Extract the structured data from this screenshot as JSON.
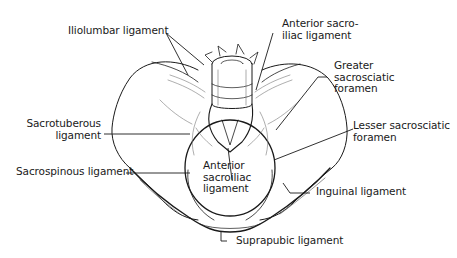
{
  "diagram": {
    "labels": [
      {
        "id": "iliolumbar",
        "text": "Iliolumbar ligament"
      },
      {
        "id": "anterior_sacroiliac_top",
        "text": "Anterior sacro-\niliac ligament"
      },
      {
        "id": "greater_sacrosciatic",
        "text": "Greater\nsacrosciatic\nforamen"
      },
      {
        "id": "sacrotuberous",
        "text": "Sacrotuberous\nligament"
      },
      {
        "id": "lesser_sacrosciatic",
        "text": "Lesser sacrosciatic\nforamen"
      },
      {
        "id": "anterior_sacroiliac_center",
        "text": "Anterior\nsacroiliac\nligament"
      },
      {
        "id": "sacrospinous",
        "text": "Sacrospinous ligament"
      },
      {
        "id": "inguinal",
        "text": "Inguinal ligament"
      },
      {
        "id": "suprapubic",
        "text": "Suprapubic ligament"
      }
    ],
    "colors": {
      "line": "#1a1a1a",
      "background": "#ffffff",
      "shade": "#8a8a8a"
    }
  }
}
